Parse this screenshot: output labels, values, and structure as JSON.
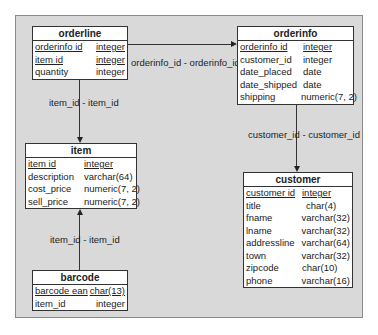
{
  "tables": {
    "orderline": {
      "title": "orderline",
      "columns": [
        {
          "name": "orderinfo id",
          "type": "integer",
          "pk": true
        },
        {
          "name": "item id",
          "type": "integer",
          "pk": true
        },
        {
          "name": "quantity",
          "type": "integer",
          "pk": false
        }
      ]
    },
    "orderinfo": {
      "title": "orderinfo",
      "columns": [
        {
          "name": "orderinfo id",
          "type": "integer",
          "pk": true
        },
        {
          "name": "customer_id",
          "type": "integer",
          "pk": false
        },
        {
          "name": "date_placed",
          "type": "date",
          "pk": false
        },
        {
          "name": "date_shipped",
          "type": "date",
          "pk": false
        },
        {
          "name": "shipping",
          "type": "numeric(7, 2)",
          "pk": false
        }
      ]
    },
    "item": {
      "title": "item",
      "columns": [
        {
          "name": "item id",
          "type": "integer",
          "pk": true
        },
        {
          "name": "description",
          "type": "varchar(64)",
          "pk": false
        },
        {
          "name": "cost_price",
          "type": "numeric(7, 2)",
          "pk": false
        },
        {
          "name": "sell_price",
          "type": "numeric(7, 2)",
          "pk": false
        }
      ]
    },
    "customer": {
      "title": "customer",
      "columns": [
        {
          "name": "customer id",
          "type": "integer",
          "pk": true
        },
        {
          "name": "title",
          "type": "char(4)",
          "pk": false
        },
        {
          "name": "fname",
          "type": "varchar(32)",
          "pk": false
        },
        {
          "name": "lname",
          "type": "varchar(32)",
          "pk": false
        },
        {
          "name": "addressline",
          "type": "varchar(64)",
          "pk": false
        },
        {
          "name": "town",
          "type": "varchar(32)",
          "pk": false
        },
        {
          "name": "zipcode",
          "type": "char(10)",
          "pk": false
        },
        {
          "name": "phone",
          "type": "varchar(16)",
          "pk": false
        }
      ]
    },
    "barcode": {
      "title": "barcode",
      "columns": [
        {
          "name": "barcode ean",
          "type": "char(13)",
          "pk": true
        },
        {
          "name": "item_id",
          "type": "integer",
          "pk": false
        }
      ]
    }
  },
  "relationships": [
    {
      "label": "orderinfo_id - orderinfo_id",
      "from": "orderline",
      "to": "orderinfo"
    },
    {
      "label": "item_id - item_id",
      "from": "orderline",
      "to": "item"
    },
    {
      "label": "customer_id - customer_id",
      "from": "orderinfo",
      "to": "customer"
    },
    {
      "label": "item_id - item_id",
      "from": "barcode",
      "to": "item"
    }
  ],
  "colors": {
    "panel": "#d9d9d9",
    "table_bg": "#ffffff",
    "border": "#333333"
  }
}
